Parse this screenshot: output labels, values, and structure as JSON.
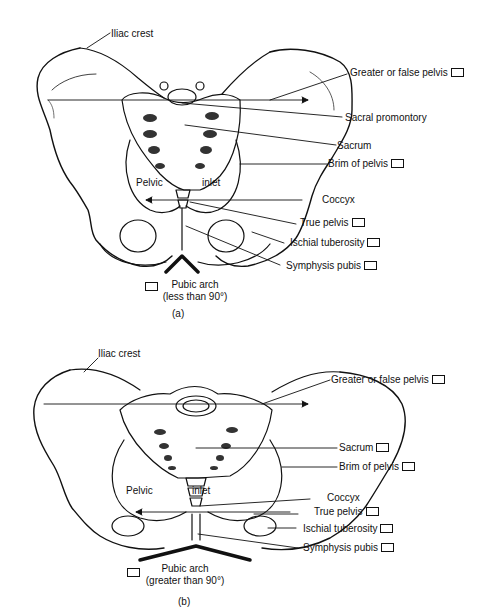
{
  "figure_a": {
    "caption": "(a)",
    "labels": {
      "iliac_crest": "Iliac crest",
      "greater_false_pelvis": "Greater or false pelvis",
      "sacral_promontory": "Sacral promontory",
      "sacrum": "Sacrum",
      "brim_of_pelvis": "Brim of pelvis",
      "coccyx": "Coccyx",
      "true_pelvis": "True pelvis",
      "ischial_tuberosity": "Ischial tuberosity",
      "symphysis_pubis": "Symphysis pubis",
      "pelvic": "Pelvic",
      "inlet": "inlet",
      "pubic_arch": "Pubic arch",
      "pubic_arch_note": "(less than 90°)"
    }
  },
  "figure_b": {
    "caption": "(b)",
    "labels": {
      "iliac_crest": "Iliac crest",
      "greater_false_pelvis": "Greater or false pelvis",
      "sacrum": "Sacrum",
      "brim_of_pelvis": "Brim of pelvis",
      "coccyx": "Coccyx",
      "true_pelvis": "True pelvis",
      "ischial_tuberosity": "Ischial tuberosity",
      "symphysis_pubis": "Symphysis pubis",
      "pelvic": "Pelvic",
      "inlet": "inlet",
      "pubic_arch": "Pubic arch",
      "pubic_arch_note": "(greater than 90°)"
    }
  }
}
